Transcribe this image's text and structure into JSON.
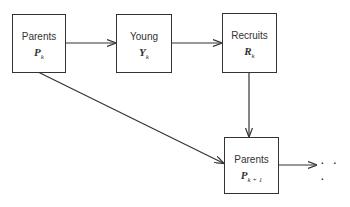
{
  "diagram": {
    "nodes": [
      {
        "id": "parents_k",
        "label": "Parents",
        "symbol": "P",
        "subscript": "k"
      },
      {
        "id": "young_k",
        "label": "Young",
        "symbol": "Y",
        "subscript": "k"
      },
      {
        "id": "recruits_k",
        "label": "Recruits",
        "symbol": "R",
        "subscript": "k"
      },
      {
        "id": "parents_k1",
        "label": "Parents",
        "symbol": "P",
        "subscript": "k + 1"
      }
    ],
    "edges": [
      {
        "from": "parents_k",
        "to": "young_k"
      },
      {
        "from": "young_k",
        "to": "recruits_k"
      },
      {
        "from": "recruits_k",
        "to": "parents_k1"
      },
      {
        "from": "parents_k",
        "to": "parents_k1"
      },
      {
        "from": "parents_k1",
        "to": "continuation"
      }
    ],
    "continuation": "· · ·"
  }
}
